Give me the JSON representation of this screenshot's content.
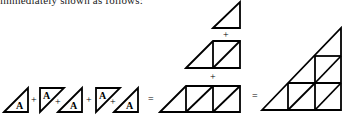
{
  "caption": "immediately shown as follows:",
  "diagram": {
    "cell_label": "A",
    "operators": {
      "plus": "+",
      "equals": "="
    },
    "left_terms": [
      {
        "kind": "triangle-up",
        "label": "A"
      },
      {
        "kind": "triangle-down",
        "label": "A"
      },
      {
        "kind": "triangle-up",
        "label": "A"
      },
      {
        "kind": "triangle-down",
        "label": "A"
      },
      {
        "kind": "triangle-up",
        "label": "A"
      },
      {
        "kind": "triangle-down",
        "label": "A"
      },
      {
        "kind": "triangle-up",
        "label": "A"
      }
    ],
    "middle_rows": [
      {
        "row": 1,
        "description": "1 triangle"
      },
      {
        "row": 2,
        "description": "1 triangle + 1 divided square"
      },
      {
        "row": 3,
        "description": "1 triangle + 2 divided squares"
      }
    ],
    "result": {
      "description": "large right triangle subdivided into 3-row triangular grid",
      "rows": 3
    }
  }
}
